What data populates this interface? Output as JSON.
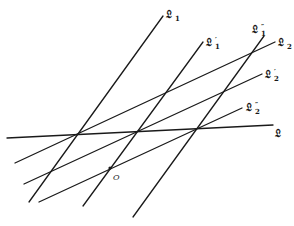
{
  "diagram": {
    "lines": [
      {
        "id": "L1",
        "x1": 29,
        "y1": 202,
        "x2": 163,
        "y2": 16
      },
      {
        "id": "L1p",
        "x1": 83,
        "y1": 206,
        "x2": 203,
        "y2": 42
      },
      {
        "id": "L1pp",
        "x1": 133,
        "y1": 217,
        "x2": 264,
        "y2": 36
      },
      {
        "id": "L2",
        "x1": 15,
        "y1": 163,
        "x2": 275,
        "y2": 42
      },
      {
        "id": "L2p",
        "x1": 24,
        "y1": 184,
        "x2": 262,
        "y2": 74
      },
      {
        "id": "L2pp",
        "x1": 39,
        "y1": 202,
        "x2": 242,
        "y2": 108
      },
      {
        "id": "L",
        "x1": 7,
        "y1": 138,
        "x2": 273,
        "y2": 125
      }
    ],
    "labels": {
      "L1": {
        "main": "𝔏",
        "sub": "1",
        "prime": ""
      },
      "L1p": {
        "main": "𝔏",
        "sub": "1",
        "prime": "′"
      },
      "L1pp": {
        "main": "𝔏",
        "sub": "1",
        "prime": "″"
      },
      "L2": {
        "main": "𝔏",
        "sub": "2",
        "prime": ""
      },
      "L2p": {
        "main": "𝔏",
        "sub": "2",
        "prime": "′"
      },
      "L2pp": {
        "main": "𝔏",
        "sub": "2",
        "prime": "″"
      },
      "L": {
        "main": "𝔏",
        "sub": "",
        "prime": ""
      }
    },
    "origin": {
      "label": "O",
      "x": 110,
      "y": 168
    }
  }
}
